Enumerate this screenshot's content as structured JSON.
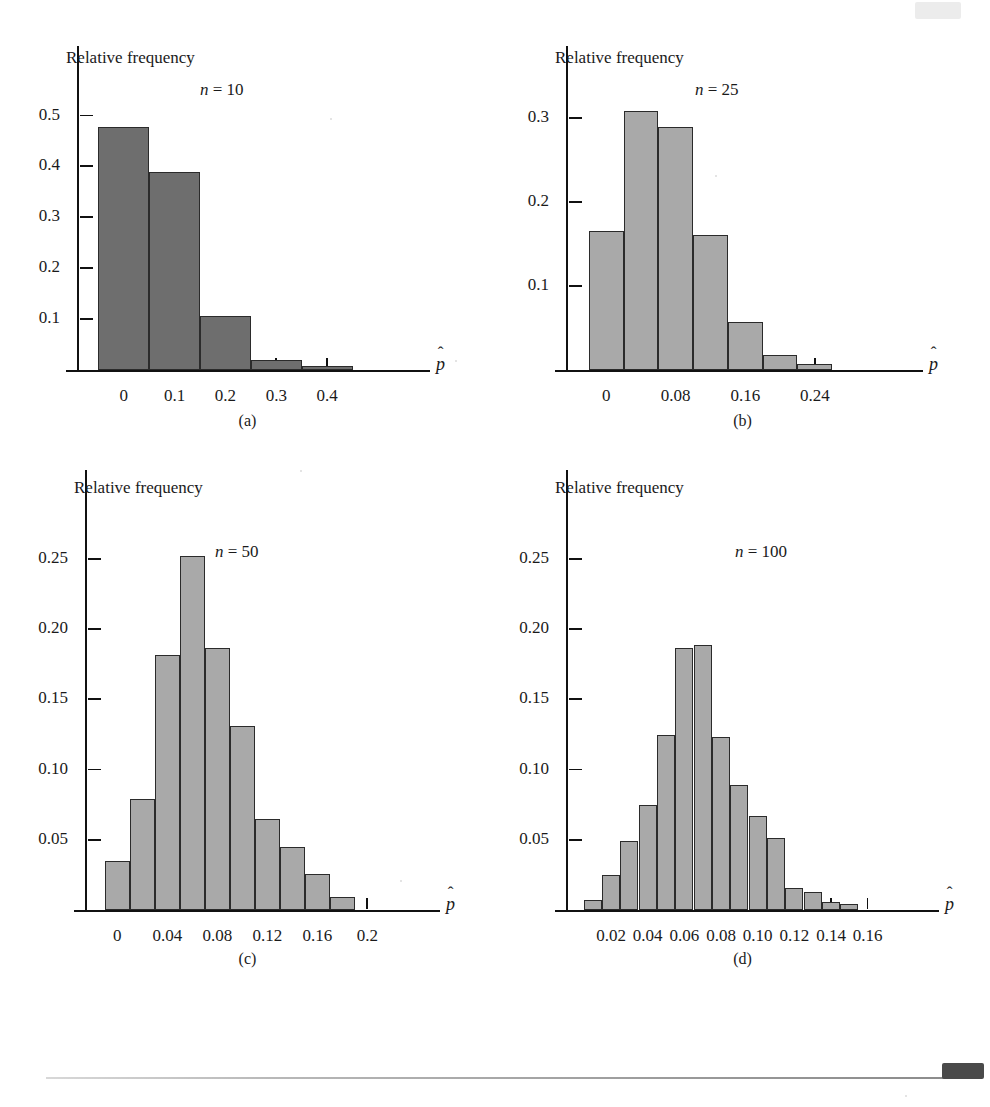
{
  "header": {
    "running_head": "",
    "tab_label": ""
  },
  "axis_titles": {
    "y": "Relative frequency",
    "x": "p̂"
  },
  "colors": {
    "bar_dark": "#6e6e6e",
    "bar_light": "#a9a9a9",
    "bar_edge": "#2b2b2b",
    "axis": "#111111",
    "text": "#1a1a1a"
  },
  "panels": [
    {
      "id": "a",
      "caption": "(a)",
      "n_label_prefix": "n",
      "n_label_eq": " = ",
      "n_label_value": "10",
      "ylabel": "Relative frequency",
      "xlabel": "p̂",
      "y_ticks": [
        "0.1",
        "0.2",
        "0.3",
        "0.4",
        "0.5"
      ],
      "x_ticks": [
        "0",
        "0.1",
        "0.2",
        "0.3",
        "0.4"
      ]
    },
    {
      "id": "b",
      "caption": "(b)",
      "n_label_prefix": "n",
      "n_label_eq": " = ",
      "n_label_value": "25",
      "ylabel": "Relative frequency",
      "xlabel": "p̂",
      "y_ticks": [
        "0.1",
        "0.2",
        "0.3"
      ],
      "x_ticks": [
        "0",
        "0.08",
        "0.16",
        "0.24"
      ]
    },
    {
      "id": "c",
      "caption": "(c)",
      "n_label_prefix": "n",
      "n_label_eq": " = ",
      "n_label_value": "50",
      "ylabel": "Relative frequency",
      "xlabel": "p̂",
      "y_ticks": [
        "0.05",
        "0.10",
        "0.15",
        "0.20",
        "0.25"
      ],
      "x_ticks": [
        "0",
        "0.04",
        "0.08",
        "0.12",
        "0.16",
        "0.2"
      ]
    },
    {
      "id": "d",
      "caption": "(d)",
      "n_label_prefix": "n",
      "n_label_eq": " = ",
      "n_label_value": "100",
      "ylabel": "Relative frequency",
      "xlabel": "p̂",
      "y_ticks": [
        "0.05",
        "0.10",
        "0.15",
        "0.20",
        "0.25"
      ],
      "x_ticks": [
        "0.02",
        "0.04",
        "0.06",
        "0.08",
        "0.10",
        "0.12",
        "0.14",
        "0.16"
      ]
    }
  ],
  "chart_data": [
    {
      "type": "bar",
      "panel": "a",
      "title": "n = 10",
      "xlabel": "p-hat",
      "ylabel": "Relative frequency",
      "bin_width": 0.1,
      "bin_centers": [
        0,
        0.1,
        0.2,
        0.3,
        0.4
      ],
      "bin_edges": [
        -0.05,
        0.05,
        0.15,
        0.25,
        0.35,
        0.45
      ],
      "categories": [
        "0",
        "0.1",
        "0.2",
        "0.3",
        "0.4"
      ],
      "values": [
        0.478,
        0.39,
        0.107,
        0.02,
        0.008
      ],
      "xlim": [
        -0.09,
        0.5
      ],
      "ylim": [
        0,
        0.57
      ],
      "ytick_values": [
        0.1,
        0.2,
        0.3,
        0.4,
        0.5
      ],
      "xtick_values": [
        0,
        0.1,
        0.2,
        0.3,
        0.4
      ],
      "grid": false,
      "legend": "none"
    },
    {
      "type": "bar",
      "panel": "b",
      "title": "n = 25",
      "xlabel": "p-hat",
      "ylabel": "Relative frequency",
      "bin_width": 0.04,
      "bin_centers": [
        0,
        0.04,
        0.08,
        0.12,
        0.16,
        0.2,
        0.24
      ],
      "bin_edges": [
        -0.02,
        0.02,
        0.06,
        0.1,
        0.14,
        0.18,
        0.22,
        0.26
      ],
      "categories": [
        "0",
        "0.04",
        "0.08",
        "0.12",
        "0.16",
        "0.20",
        "0.24"
      ],
      "values": [
        0.165,
        0.308,
        0.289,
        0.161,
        0.057,
        0.018,
        0.007
      ],
      "xlim": [
        -0.045,
        0.3
      ],
      "ylim": [
        0,
        0.345
      ],
      "ytick_values": [
        0.1,
        0.2,
        0.3
      ],
      "xtick_values": [
        0,
        0.08,
        0.16,
        0.24
      ],
      "grid": false,
      "legend": "none"
    },
    {
      "type": "bar",
      "panel": "c",
      "title": "n = 50",
      "xlabel": "p-hat",
      "ylabel": "Relative frequency",
      "bin_width": 0.02,
      "bin_centers": [
        0,
        0.02,
        0.04,
        0.06,
        0.08,
        0.1,
        0.12,
        0.14,
        0.16,
        0.18
      ],
      "bin_edges": [
        -0.01,
        0.01,
        0.03,
        0.05,
        0.07,
        0.09,
        0.11,
        0.13,
        0.15,
        0.17,
        0.19
      ],
      "categories": [
        "0",
        "0.02",
        "0.04",
        "0.06",
        "0.08",
        "0.10",
        "0.12",
        "0.14",
        "0.16",
        "0.18"
      ],
      "values": [
        0.035,
        0.079,
        0.182,
        0.252,
        0.187,
        0.131,
        0.065,
        0.045,
        0.026,
        0.009
      ],
      "xlim": [
        -0.025,
        0.215
      ],
      "ylim": [
        0,
        0.285
      ],
      "ytick_values": [
        0.05,
        0.1,
        0.15,
        0.2,
        0.25
      ],
      "xtick_values": [
        0,
        0.04,
        0.08,
        0.12,
        0.16,
        0.2
      ],
      "grid": false,
      "legend": "none"
    },
    {
      "type": "bar",
      "panel": "d",
      "title": "n = 100",
      "xlabel": "p-hat",
      "ylabel": "Relative frequency",
      "bin_width": 0.01,
      "bin_centers": [
        0.01,
        0.02,
        0.03,
        0.04,
        0.05,
        0.06,
        0.07,
        0.08,
        0.09,
        0.1,
        0.11,
        0.12,
        0.13,
        0.14,
        0.15
      ],
      "bin_edges": [
        0.005,
        0.015,
        0.025,
        0.035,
        0.045,
        0.055,
        0.065,
        0.075,
        0.085,
        0.095,
        0.105,
        0.115,
        0.125,
        0.135,
        0.145,
        0.155
      ],
      "categories": [
        "0.01",
        "0.02",
        "0.03",
        "0.04",
        "0.05",
        "0.06",
        "0.07",
        "0.08",
        "0.09",
        "0.10",
        "0.11",
        "0.12",
        "0.13",
        "0.14",
        "0.15"
      ],
      "values": [
        0.007,
        0.025,
        0.049,
        0.075,
        0.125,
        0.187,
        0.189,
        0.123,
        0.089,
        0.067,
        0.051,
        0.016,
        0.013,
        0.006,
        0.004
      ],
      "xlim": [
        -0.004,
        0.176
      ],
      "ylim": [
        0,
        0.285
      ],
      "ytick_values": [
        0.05,
        0.1,
        0.15,
        0.2,
        0.25
      ],
      "xtick_values": [
        0.02,
        0.04,
        0.06,
        0.08,
        0.1,
        0.12,
        0.14,
        0.16
      ],
      "grid": false,
      "legend": "none"
    }
  ]
}
